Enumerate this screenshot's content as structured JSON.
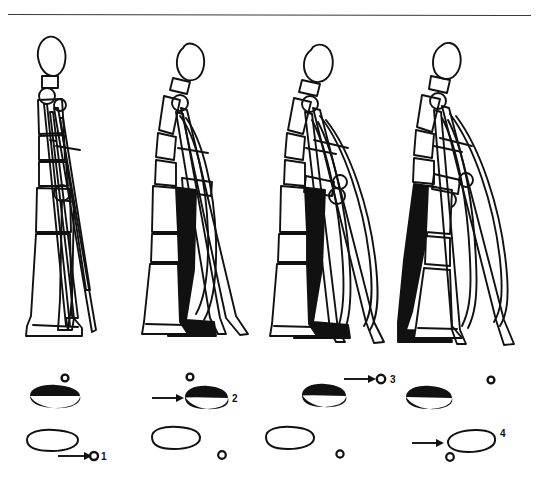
{
  "figure": {
    "kind": "line-drawing",
    "background_color": "#ffffff",
    "ink_color": "#111111",
    "rule": {
      "present": true,
      "x1": 8,
      "x2": 531,
      "y": 14,
      "thickness": 1
    },
    "panels": [
      {
        "index": 1,
        "name": "phase-1",
        "figure_label": "",
        "center_x": 62,
        "description": "standing figure, both crutches forward together, near leg outlined, far leg outlined"
      },
      {
        "index": 2,
        "name": "phase-2",
        "figure_label": "",
        "center_x": 195,
        "description": "figure leaning, crutches planted forward, far leg filled solid black"
      },
      {
        "index": 3,
        "name": "phase-3",
        "figure_label": "",
        "center_x": 325,
        "description": "figure swinging through, crutches splayed, far leg filled solid black"
      },
      {
        "index": 4,
        "name": "phase-4",
        "figure_label": "",
        "center_x": 455,
        "description": "figure stepping past crutches, far leg filled solid black, near foot forward"
      }
    ],
    "footfall_diagram": {
      "caption": "",
      "columns": [
        {
          "index": 1,
          "name": "footfall-column-1",
          "crutch_tip_top": {
            "cx": 65,
            "cy": 378,
            "r": 3.4,
            "filled": false
          },
          "foot_black": {
            "cx": 55,
            "cy": 396,
            "filled": true
          },
          "foot_outline": {
            "cx": 52,
            "cy": 440,
            "filled": false
          },
          "crutch_tip_bottom": {
            "cx": 92,
            "cy": 456,
            "r": 4.2,
            "filled": false
          },
          "arrow": {
            "x1": 60,
            "x2": 86,
            "y": 456,
            "target": "crutch-tip-bottom"
          },
          "number": "1",
          "number_x": 99,
          "number_y": 459
        },
        {
          "index": 2,
          "name": "footfall-column-2",
          "crutch_tip_top": {
            "cx": 190,
            "cy": 377,
            "r": 3.4,
            "filled": false
          },
          "foot_black": {
            "cx": 200,
            "cy": 398,
            "filled": true
          },
          "foot_outline": {
            "cx": 173,
            "cy": 437,
            "filled": false
          },
          "crutch_tip_bottom": {
            "cx": 222,
            "cy": 455,
            "r": 3.8,
            "filled": false
          },
          "arrow": {
            "x1": 152,
            "x2": 180,
            "y": 398,
            "target": "foot-black"
          },
          "number": "2",
          "number_x": 231,
          "number_y": 402
        },
        {
          "index": 3,
          "name": "footfall-column-3",
          "crutch_tip_top": {
            "cx": 380,
            "cy": 379,
            "r": 4.2,
            "filled": false
          },
          "foot_black": {
            "cx": 322,
            "cy": 394,
            "filled": true
          },
          "foot_outline": {
            "cx": 288,
            "cy": 437,
            "filled": false
          },
          "crutch_tip_bottom": {
            "cx": 340,
            "cy": 454,
            "r": 3.6,
            "filled": false
          },
          "arrow": {
            "x1": 344,
            "x2": 372,
            "y": 379,
            "target": "crutch-tip-top"
          },
          "number": "3",
          "number_x": 389,
          "number_y": 383
        },
        {
          "index": 4,
          "name": "footfall-column-4",
          "crutch_tip_top": {
            "cx": 490,
            "cy": 380,
            "r": 3.4,
            "filled": false
          },
          "foot_black": {
            "cx": 428,
            "cy": 396,
            "filled": true
          },
          "foot_outline": {
            "cx": 470,
            "cy": 440,
            "filled": false
          },
          "crutch_tip_bottom": {
            "cx": 450,
            "cy": 457,
            "r": 3.8,
            "filled": false
          },
          "arrow": {
            "x1": 412,
            "x2": 440,
            "y": 442,
            "target": "foot-outline"
          },
          "number": "4",
          "number_x": 500,
          "number_y": 437
        }
      ],
      "legend_numbers": [
        "1",
        "2",
        "3",
        "4"
      ]
    }
  }
}
